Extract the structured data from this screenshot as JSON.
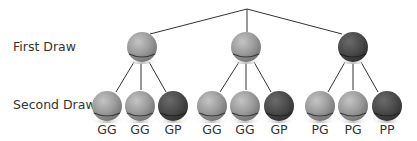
{
  "diagram": {
    "type": "tree",
    "row_labels": {
      "first": "First Draw",
      "second": "Second Draw"
    },
    "colors": {
      "G": "#9a9a9a",
      "P": "#4a4a4a",
      "line": "#333333",
      "text": "#333333"
    },
    "first_draw": [
      {
        "color": "G",
        "children": [
          {
            "color": "G",
            "label": "GG"
          },
          {
            "color": "G",
            "label": "GG"
          },
          {
            "color": "P",
            "label": "GP"
          }
        ]
      },
      {
        "color": "G",
        "children": [
          {
            "color": "G",
            "label": "GG"
          },
          {
            "color": "G",
            "label": "GG"
          },
          {
            "color": "P",
            "label": "GP"
          }
        ]
      },
      {
        "color": "P",
        "children": [
          {
            "color": "G",
            "label": "PG"
          },
          {
            "color": "G",
            "label": "PG"
          },
          {
            "color": "P",
            "label": "PP"
          }
        ]
      }
    ],
    "leaves": [
      "GG",
      "GG",
      "GP",
      "GG",
      "GG",
      "GP",
      "PG",
      "PG",
      "PP"
    ]
  }
}
